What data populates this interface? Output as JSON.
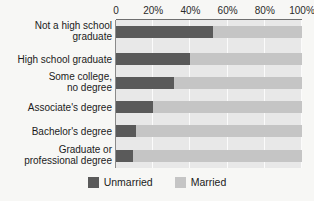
{
  "title_remnant": "",
  "axis": {
    "ticks": [
      "0",
      "20%",
      "40%",
      "60%",
      "80%",
      "100%"
    ],
    "tick_values": [
      0,
      20,
      40,
      60,
      80,
      100
    ]
  },
  "legend": {
    "items": [
      {
        "label": "Unmarried",
        "color": "#5a5a5a"
      },
      {
        "label": "Married",
        "color": "#c5c5c5"
      }
    ]
  },
  "colors": {
    "unmarried": "#5a5a5a",
    "married": "#c5c5c5",
    "plot_band": "#e8e8e8",
    "gridline": "#fbfbfb",
    "page_background": "#f7f7f5",
    "axis_rule": "#6f6f6f",
    "text": "#1b1b1b"
  },
  "chart_data": {
    "type": "bar",
    "orientation": "horizontal",
    "stacked": true,
    "normalized_percent": true,
    "title": "",
    "xlabel": "",
    "ylabel": "",
    "xlim": [
      0,
      100
    ],
    "grid": true,
    "legend_position": "bottom",
    "categories": [
      "Not a high school\ngraduate",
      "High school graduate",
      "Some college,\nno degree",
      "Associate's degree",
      "Bachelor's degree",
      "Graduate or\nprofessional degree"
    ],
    "series": [
      {
        "name": "Unmarried",
        "color": "#5a5a5a",
        "values": [
          52,
          40,
          31,
          20,
          11,
          9
        ]
      },
      {
        "name": "Married",
        "color": "#c5c5c5",
        "values": [
          48,
          60,
          69,
          80,
          89,
          91
        ]
      }
    ]
  }
}
